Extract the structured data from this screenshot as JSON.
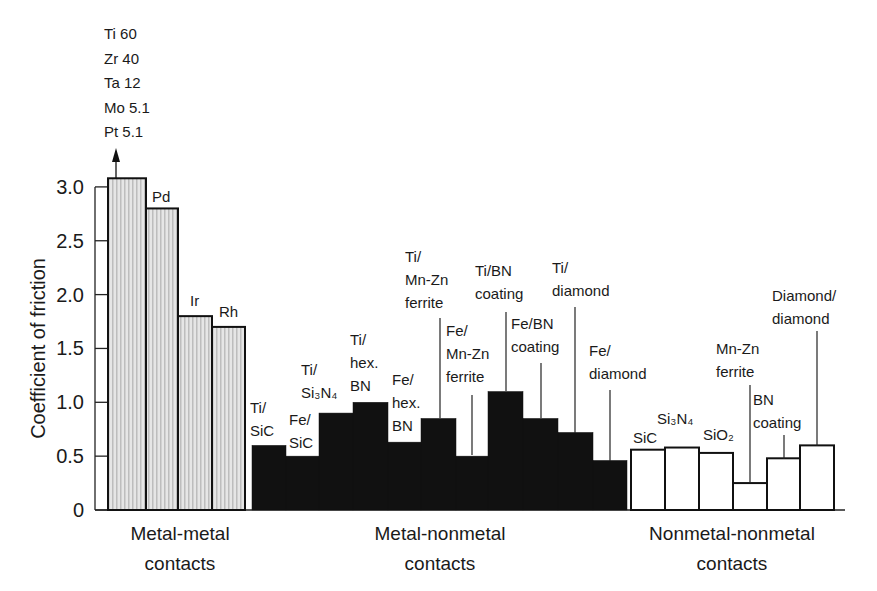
{
  "chart_data": {
    "type": "bar",
    "title": "",
    "xlabel": "",
    "ylabel": "Coefficient of friction",
    "ylim": [
      0,
      3.0
    ],
    "yticks": [
      "0",
      "0.5",
      "1.0",
      "1.5",
      "2.0",
      "2.5",
      "3.0"
    ],
    "grid": false,
    "legend": "none",
    "off_scale_annotation": {
      "lines": [
        "Ti 60",
        "Zr 40",
        "Ta 12",
        "Mo 5.1",
        "Pt 5.1"
      ],
      "note": "arrow indicates values above axis range"
    },
    "groups": [
      {
        "name": "Metal-metal contacts",
        "label_lines": [
          "Metal-metal",
          "contacts"
        ],
        "fill": "#d9d9d9"
      },
      {
        "name": "Metal-nonmetal contacts",
        "label_lines": [
          "Metal-nonmetal",
          "contacts"
        ],
        "fill": "#111111"
      },
      {
        "name": "Nonmetal-nonmetal contacts",
        "label_lines": [
          "Nonmetal-nonmetal",
          "contacts"
        ],
        "fill": "#ffffff"
      }
    ],
    "bars": [
      {
        "group": 0,
        "label": "Ti, Zr, Ta, Mo, Pt",
        "value": 3.08,
        "x0": 108,
        "x1": 146
      },
      {
        "group": 0,
        "label": "Pd",
        "value": 2.8,
        "x0": 146,
        "x1": 178
      },
      {
        "group": 0,
        "label": "Ir",
        "value": 1.8,
        "x0": 178,
        "x1": 212
      },
      {
        "group": 0,
        "label": "Rh",
        "value": 1.7,
        "x0": 212,
        "x1": 245
      },
      {
        "group": 1,
        "label": "Ti/SiC",
        "value": 0.6,
        "x0": 252,
        "x1": 286
      },
      {
        "group": 1,
        "label": "Fe/SiC",
        "value": 0.5,
        "x0": 286,
        "x1": 319
      },
      {
        "group": 1,
        "label": "Ti/Si3N4",
        "value": 0.9,
        "x0": 319,
        "x1": 353
      },
      {
        "group": 1,
        "label": "Ti/hex. BN",
        "value": 1.0,
        "x0": 353,
        "x1": 388
      },
      {
        "group": 1,
        "label": "Fe/hex. BN",
        "value": 0.63,
        "x0": 388,
        "x1": 421
      },
      {
        "group": 1,
        "label": "Ti/Mn-Zn ferrite",
        "value": 0.85,
        "x0": 421,
        "x1": 456
      },
      {
        "group": 1,
        "label": "Fe/Mn-Zn ferrite",
        "value": 0.5,
        "x0": 456,
        "x1": 488
      },
      {
        "group": 1,
        "label": "Ti/BN coating",
        "value": 1.1,
        "x0": 488,
        "x1": 523
      },
      {
        "group": 1,
        "label": "Fe/BN coating",
        "value": 0.85,
        "x0": 523,
        "x1": 558
      },
      {
        "group": 1,
        "label": "Ti/diamond",
        "value": 0.72,
        "x0": 558,
        "x1": 593
      },
      {
        "group": 1,
        "label": "Fe/diamond",
        "value": 0.46,
        "x0": 593,
        "x1": 627
      },
      {
        "group": 2,
        "label": "SiC",
        "value": 0.56,
        "x0": 631,
        "x1": 665
      },
      {
        "group": 2,
        "label": "Si3N4",
        "value": 0.58,
        "x0": 665,
        "x1": 699
      },
      {
        "group": 2,
        "label": "SiO2",
        "value": 0.53,
        "x0": 699,
        "x1": 733
      },
      {
        "group": 2,
        "label": "Mn-Zn ferrite",
        "value": 0.25,
        "x0": 733,
        "x1": 767
      },
      {
        "group": 2,
        "label": "BN coating",
        "value": 0.48,
        "x0": 767,
        "x1": 800
      },
      {
        "group": 2,
        "label": "Diamond/diamond",
        "value": 0.6,
        "x0": 800,
        "x1": 834
      }
    ],
    "bar_labels": [
      {
        "lines": [
          "Pd"
        ],
        "x": 152,
        "y": 202
      },
      {
        "lines": [
          "Ir"
        ],
        "x": 190,
        "y": 306
      },
      {
        "lines": [
          "Rh"
        ],
        "x": 219,
        "y": 317
      },
      {
        "lines": [
          "Ti/",
          "SiC"
        ],
        "x": 250,
        "y": 413
      },
      {
        "lines": [
          "Fe/",
          "SiC"
        ],
        "x": 289,
        "y": 425
      },
      {
        "lines": [
          "Ti/",
          "Si₃N₄"
        ],
        "x": 301,
        "y": 375
      },
      {
        "lines": [
          "Ti/",
          "hex.",
          "BN"
        ],
        "x": 350,
        "y": 345
      },
      {
        "lines": [
          "Fe/",
          "hex.",
          "BN"
        ],
        "x": 392,
        "y": 385
      },
      {
        "lines": [
          "Ti/",
          "Mn-Zn",
          "ferrite"
        ],
        "x": 405,
        "y": 262,
        "leader": {
          "x": 440,
          "y1": 318,
          "y2": 418
        }
      },
      {
        "lines": [
          "Fe/",
          "Mn-Zn",
          "ferrite"
        ],
        "x": 446,
        "y": 336,
        "leader": {
          "x": 472,
          "y1": 395,
          "y2": 455
        }
      },
      {
        "lines": [
          "Ti/BN",
          "coating"
        ],
        "x": 475,
        "y": 276,
        "leader": {
          "x": 506,
          "y1": 312,
          "y2": 391
        }
      },
      {
        "lines": [
          "Fe/BN",
          "coating"
        ],
        "x": 511,
        "y": 329,
        "leader": {
          "x": 541,
          "y1": 363,
          "y2": 418
        }
      },
      {
        "lines": [
          "Ti/",
          "diamond"
        ],
        "x": 552,
        "y": 273,
        "leader": {
          "x": 575,
          "y1": 307,
          "y2": 433
        }
      },
      {
        "lines": [
          "Fe/",
          "diamond"
        ],
        "x": 589,
        "y": 356,
        "leader": {
          "x": 610,
          "y1": 390,
          "y2": 461
        }
      },
      {
        "lines": [
          "SiC"
        ],
        "x": 633,
        "y": 443
      },
      {
        "lines": [
          "Si₃N₄"
        ],
        "x": 657,
        "y": 424
      },
      {
        "lines": [
          "SiO₂"
        ],
        "x": 703,
        "y": 440
      },
      {
        "lines": [
          "Mn-Zn",
          "ferrite"
        ],
        "x": 716,
        "y": 354,
        "leader": {
          "x": 750,
          "y1": 385,
          "y2": 483
        }
      },
      {
        "lines": [
          "BN",
          "coating"
        ],
        "x": 753,
        "y": 405,
        "leader": {
          "x": 784,
          "y1": 435,
          "y2": 459
        }
      },
      {
        "lines": [
          "Diamond/",
          "diamond"
        ],
        "x": 772,
        "y": 301,
        "leader": {
          "x": 817,
          "y1": 331,
          "y2": 446
        }
      }
    ]
  }
}
